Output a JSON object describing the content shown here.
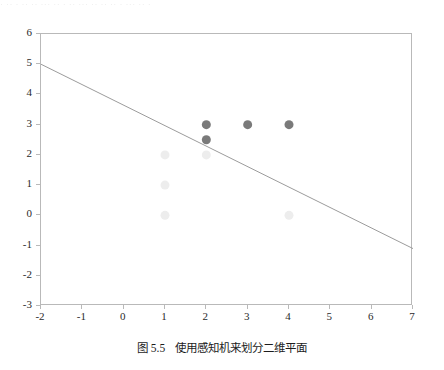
{
  "page": {
    "top_text_remnant": "· ·· · ·· ·· ··· ·· · ·· ··· ·· ·· ·· · ··· ·· ·"
  },
  "caption": {
    "number": "图 5.5",
    "text": "使用感知机来划分二维平面"
  },
  "colors": {
    "background": "#ffffff",
    "spine": "#b9b9b9",
    "tick_label": "#2a2a2a",
    "decision_line": "#9b9b9b",
    "class_positive_marker": "#7a7a7a",
    "class_negative_marker": "#ededed"
  },
  "chart_data": {
    "type": "scatter",
    "title": "",
    "xlabel": "",
    "ylabel": "",
    "xlim": [
      -2,
      7
    ],
    "ylim": [
      -3,
      6
    ],
    "xticks": [
      -2,
      -1,
      0,
      1,
      2,
      3,
      4,
      5,
      6,
      7
    ],
    "yticks": [
      -3,
      -2,
      -1,
      0,
      1,
      2,
      3,
      4,
      5,
      6
    ],
    "xtick_labels": [
      "-2",
      "-1",
      "0",
      "1",
      "2",
      "3",
      "4",
      "5",
      "6",
      "7"
    ],
    "ytick_labels": [
      "-3",
      "-2",
      "-1",
      "0",
      "1",
      "2",
      "3",
      "4",
      "5",
      "6"
    ],
    "grid": false,
    "legend": null,
    "series": [
      {
        "name": "class-positive",
        "marker": "circle",
        "color": "#7a7a7a",
        "size": 9,
        "points": [
          {
            "x": 2,
            "y": 3
          },
          {
            "x": 3,
            "y": 3
          },
          {
            "x": 4,
            "y": 3
          },
          {
            "x": 2,
            "y": 2.5
          }
        ]
      },
      {
        "name": "class-negative",
        "marker": "circle",
        "color": "#ededed",
        "size": 9,
        "points": [
          {
            "x": 1,
            "y": 2
          },
          {
            "x": 2,
            "y": 2
          },
          {
            "x": 1,
            "y": 1
          },
          {
            "x": 1,
            "y": 0
          },
          {
            "x": 4,
            "y": 0
          }
        ]
      }
    ],
    "annotations": [
      {
        "type": "line",
        "name": "decision-boundary",
        "color": "#9b9b9b",
        "width": 1,
        "x0": -2,
        "y0": 5,
        "x1": 7,
        "y1": -1.1
      }
    ]
  }
}
